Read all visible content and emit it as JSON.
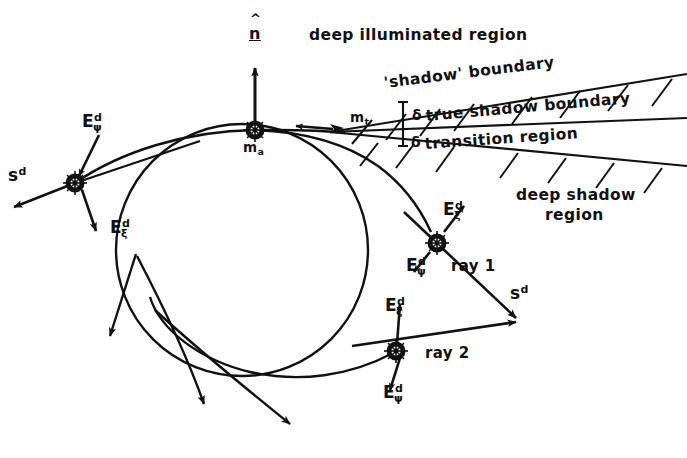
{
  "figure": {
    "width": 687,
    "height": 458,
    "background": "#ffffff",
    "ink": "#111111"
  },
  "regions": {
    "deep_illuminated": "deep illuminated region",
    "shadow_boundary": "'shadow' boundary",
    "true_shadow_boundary": "true shadow boundary",
    "transition_region": "transition region",
    "deep_shadow_line1": "deep shadow",
    "deep_shadow_line2": "region"
  },
  "points": {
    "attachment": {
      "base": "m",
      "sub": "a"
    },
    "tangent": {
      "base": "m",
      "sub": "t"
    }
  },
  "normal": {
    "symbol": "n",
    "hat": "^"
  },
  "deltas": {
    "upper": "δ",
    "lower": "δ"
  },
  "rays": {
    "ray1": "ray 1",
    "ray2": "ray 2"
  },
  "fields": {
    "E": "E",
    "sup_d": "d",
    "sub_xi": "ξ",
    "sub_psi": "ψ",
    "s": "s"
  },
  "vector_labels": [
    {
      "id": "s-d-left",
      "base": "s",
      "sup": "d",
      "sub": "",
      "x": 8,
      "y": 166
    },
    {
      "id": "E-psi-left",
      "base": "E",
      "sup": "d",
      "sub": "ψ",
      "x": 82,
      "y": 112
    },
    {
      "id": "E-xi-left",
      "base": "E",
      "sup": "d",
      "sub": "ξ",
      "x": 110,
      "y": 218
    },
    {
      "id": "E-xi-ray1",
      "base": "E",
      "sup": "d",
      "sub": "ξ",
      "x": 443,
      "y": 200
    },
    {
      "id": "E-psi-ray1",
      "base": "E",
      "sup": "d",
      "sub": "ψ",
      "x": 406,
      "y": 256
    },
    {
      "id": "s-d-ray1",
      "base": "s",
      "sup": "d",
      "sub": "",
      "x": 510,
      "y": 284
    },
    {
      "id": "E-xi-ray2",
      "base": "E",
      "sup": "d",
      "sub": "ξ",
      "x": 385,
      "y": 296
    },
    {
      "id": "E-psi-ray2",
      "base": "E",
      "sup": "d",
      "sub": "ψ",
      "x": 383,
      "y": 383
    }
  ],
  "geometry": {
    "circle": {
      "cx": 242,
      "cy": 250,
      "r": 126
    },
    "hub_attachment": {
      "x": 255,
      "y": 130
    },
    "hub_left": {
      "x": 75,
      "y": 183
    },
    "hub_ray1": {
      "x": 437,
      "y": 243
    },
    "hub_ray2": {
      "x": 396,
      "y": 351
    },
    "ray_convergence": {
      "x": 518,
      "y": 320
    },
    "normal_arrow_tip": {
      "x": 255,
      "y": 68
    },
    "wedge_apex": {
      "x": 330,
      "y": 132
    }
  }
}
